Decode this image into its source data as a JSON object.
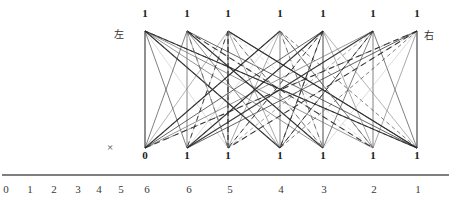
{
  "figure": {
    "left_label": "左",
    "right_label": "右",
    "cross_symbol": "×"
  },
  "graph": {
    "top_nodes": [
      {
        "label": "1",
        "x": 145
      },
      {
        "label": "1",
        "x": 187
      },
      {
        "label": "1",
        "x": 228
      },
      {
        "label": "1",
        "x": 280
      },
      {
        "label": "1",
        "x": 323
      },
      {
        "label": "1",
        "x": 373
      },
      {
        "label": "1",
        "x": 417
      }
    ],
    "bottom_nodes": [
      {
        "label": "0",
        "x": 145
      },
      {
        "label": "1",
        "x": 187
      },
      {
        "label": "1",
        "x": 228
      },
      {
        "label": "1",
        "x": 280
      },
      {
        "label": "1",
        "x": 323
      },
      {
        "label": "1",
        "x": 373
      },
      {
        "label": "1",
        "x": 417
      }
    ],
    "top_y": 31,
    "bottom_y": 148
  },
  "axis": {
    "line_y": 175,
    "ticks": [
      {
        "label": "0",
        "x": 6
      },
      {
        "label": "1",
        "x": 30
      },
      {
        "label": "2",
        "x": 54
      },
      {
        "label": "3",
        "x": 78
      },
      {
        "label": "4",
        "x": 99
      },
      {
        "label": "5",
        "x": 121
      },
      {
        "label": "6",
        "x": 147
      },
      {
        "label": "6",
        "x": 189
      },
      {
        "label": "5",
        "x": 230
      },
      {
        "label": "4",
        "x": 281
      },
      {
        "label": "3",
        "x": 324
      },
      {
        "label": "2",
        "x": 374
      },
      {
        "label": "1",
        "x": 418
      }
    ]
  },
  "style": {
    "ink": "#2b2b2b",
    "mid": "#6e6e6e",
    "light": "#b9b9b9",
    "axis_color": "#555555"
  }
}
